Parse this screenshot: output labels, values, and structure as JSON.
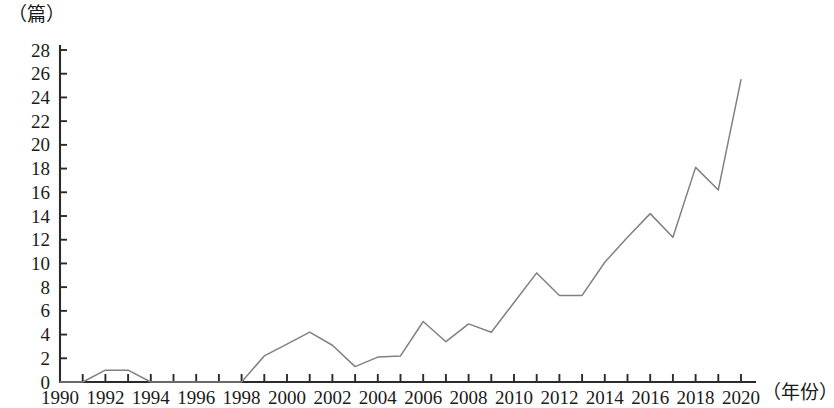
{
  "figure": {
    "unit_label": "（篇）",
    "xaxis_title": "（年份）"
  },
  "chart_data": {
    "type": "line",
    "title": "",
    "subtitle": "",
    "xlabel": "（年份）",
    "ylabel": "（篇）",
    "xlim": [
      1990,
      2020
    ],
    "ylim": [
      0,
      28
    ],
    "ytick_step": 2,
    "xtick_step": 2,
    "grid": false,
    "legend": null,
    "legend_position": "none",
    "line_color": "#808080",
    "axis_color": "#2b2b2b",
    "ytick_labels": [
      "0",
      "2",
      "4",
      "6",
      "8",
      "10",
      "12",
      "14",
      "16",
      "18",
      "20",
      "22",
      "24",
      "26",
      "28"
    ],
    "ytick_values": [
      0,
      2,
      4,
      6,
      8,
      10,
      12,
      14,
      16,
      18,
      20,
      22,
      24,
      26,
      28
    ],
    "xtick_labels": [
      "1990",
      "1992",
      "1994",
      "1996",
      "1998",
      "2000",
      "2002",
      "2004",
      "2006",
      "2008",
      "2010",
      "2012",
      "2014",
      "2016",
      "2018",
      "2020"
    ],
    "xtick_values": [
      1990,
      1992,
      1994,
      1996,
      1998,
      2000,
      2002,
      2004,
      2006,
      2008,
      2010,
      2012,
      2014,
      2016,
      2018,
      2020
    ],
    "x": [
      1990,
      1991,
      1992,
      1993,
      1994,
      1995,
      1996,
      1997,
      1998,
      1999,
      2000,
      2001,
      2002,
      2003,
      2004,
      2005,
      2006,
      2007,
      2008,
      2009,
      2010,
      2011,
      2012,
      2013,
      2014,
      2015,
      2016,
      2017,
      2018,
      2019,
      2020
    ],
    "values": [
      0,
      0,
      1,
      1,
      0,
      0,
      0,
      0,
      0,
      2.2,
      3.2,
      4.2,
      3.1,
      1.3,
      2.1,
      2.2,
      5.1,
      3.4,
      4.9,
      4.2,
      6.7,
      9.2,
      7.3,
      7.3,
      10.1,
      12.2,
      14.2,
      12.2,
      18.1,
      16.2,
      25.5
    ],
    "series": [
      {
        "name": "文献数量",
        "values": [
          0,
          0,
          1,
          1,
          0,
          0,
          0,
          0,
          0,
          2.2,
          3.2,
          4.2,
          3.1,
          1.3,
          2.1,
          2.2,
          5.1,
          3.4,
          4.9,
          4.2,
          6.7,
          9.2,
          7.3,
          7.3,
          10.1,
          12.2,
          14.2,
          12.2,
          18.1,
          16.2,
          25.5
        ]
      }
    ]
  }
}
